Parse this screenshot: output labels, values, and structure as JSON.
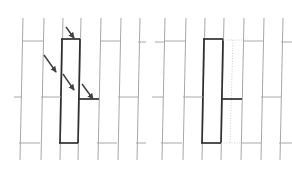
{
  "figure": {
    "background_color": "#ffffff",
    "width": 292,
    "height": 179,
    "colors": {
      "thin_line": "#a8a8a8",
      "thin_line_light": "#bdbdbd",
      "bold_line": "#303030",
      "dotted_line": "#c9c9c9",
      "arrow": "#404040",
      "caption_text": "#ededed"
    },
    "line_widths": {
      "thin": 1.0,
      "bold": 1.7,
      "dotted": 0.9
    }
  },
  "panels": [
    {
      "id": "panel-left",
      "name": "left-panel",
      "label": "",
      "origin_x": 8,
      "width": 136,
      "verticals": [
        {
          "name": "vline-1",
          "x_top": 23,
          "x_bottom": 20,
          "y1": 18,
          "y2": 160,
          "style": "thin"
        },
        {
          "name": "vline-2",
          "x_top": 44,
          "x_bottom": 41,
          "y1": 18,
          "y2": 160,
          "style": "thin"
        },
        {
          "name": "vline-3",
          "x_top": 63,
          "x_bottom": 60,
          "y1": 18,
          "y2": 160,
          "style": "thin"
        },
        {
          "name": "vline-4-bold-left",
          "x_top": 62,
          "x_bottom": 60,
          "y1": 39,
          "y2": 143,
          "style": "bold"
        },
        {
          "name": "vline-5",
          "x_top": 81,
          "x_bottom": 78,
          "y1": 18,
          "y2": 160,
          "style": "thin"
        },
        {
          "name": "vline-6-bold-right",
          "x_top": 80,
          "x_bottom": 78,
          "y1": 39,
          "y2": 143,
          "style": "bold"
        },
        {
          "name": "vline-7",
          "x_top": 101,
          "x_bottom": 98,
          "y1": 18,
          "y2": 160,
          "style": "thin"
        },
        {
          "name": "vline-8",
          "x_top": 121,
          "x_bottom": 118,
          "y1": 18,
          "y2": 160,
          "style": "thin"
        },
        {
          "name": "vline-9",
          "x_top": 140,
          "x_bottom": 137,
          "y1": 18,
          "y2": 160,
          "style": "thin"
        }
      ],
      "horizontals": [
        {
          "name": "hline-top-left",
          "x1": 22,
          "x2": 43,
          "y": 41,
          "style": "thin"
        },
        {
          "name": "hline-top-bold",
          "x1": 61,
          "x2": 80,
          "y": 39,
          "style": "bold"
        },
        {
          "name": "hline-top-right",
          "x1": 100,
          "x2": 120,
          "y": 41,
          "style": "thin"
        },
        {
          "name": "hline-top-edge",
          "x1": 138,
          "x2": 146,
          "y": 42,
          "style": "thin"
        },
        {
          "name": "hline-mid-left-stub",
          "x1": 14,
          "x2": 22,
          "y": 97,
          "style": "thin"
        },
        {
          "name": "hline-mid-a",
          "x1": 41,
          "x2": 61,
          "y": 97,
          "style": "thin"
        },
        {
          "name": "hline-mid-bold",
          "x1": 79,
          "x2": 99,
          "y": 99,
          "style": "bold"
        },
        {
          "name": "hline-mid-b",
          "x1": 118,
          "x2": 138,
          "y": 97,
          "style": "thin"
        },
        {
          "name": "hline-bot-left",
          "x1": 19,
          "x2": 40,
          "y": 143,
          "style": "thin"
        },
        {
          "name": "hline-bot-bold",
          "x1": 59,
          "x2": 78,
          "y": 143,
          "style": "bold"
        },
        {
          "name": "hline-bot-right",
          "x1": 97,
          "x2": 117,
          "y": 143,
          "style": "thin"
        },
        {
          "name": "hline-bot-edge",
          "x1": 136,
          "x2": 146,
          "y": 143,
          "style": "thin"
        }
      ],
      "highlighted_cell": {
        "name": "highlighted-cell-left",
        "x_left": 61,
        "x_right": 80,
        "y_top": 39,
        "y_bottom": 143
      },
      "arrows": [
        {
          "name": "arrow-1",
          "x1": 66,
          "y1": 27,
          "x2": 74,
          "y2": 38
        },
        {
          "name": "arrow-2",
          "x1": 44,
          "y1": 55,
          "x2": 56,
          "y2": 72
        },
        {
          "name": "arrow-3",
          "x1": 63,
          "y1": 74,
          "x2": 74,
          "y2": 90
        },
        {
          "name": "arrow-4",
          "x1": 82,
          "y1": 84,
          "x2": 93,
          "y2": 99
        }
      ]
    },
    {
      "id": "panel-right",
      "name": "right-panel",
      "label": "",
      "origin_x": 152,
      "width": 136,
      "verticals": [
        {
          "name": "vline-1",
          "x_top": 165,
          "x_bottom": 162,
          "y1": 18,
          "y2": 160,
          "style": "thin"
        },
        {
          "name": "vline-2",
          "x_top": 186,
          "x_bottom": 183,
          "y1": 18,
          "y2": 160,
          "style": "thin"
        },
        {
          "name": "vline-3",
          "x_top": 205,
          "x_bottom": 202,
          "y1": 18,
          "y2": 160,
          "style": "thin"
        },
        {
          "name": "vline-4-bold",
          "x_top": 204,
          "x_bottom": 202,
          "y1": 39,
          "y2": 143,
          "style": "bold"
        },
        {
          "name": "vline-5",
          "x_top": 224,
          "x_bottom": 221,
          "y1": 18,
          "y2": 160,
          "style": "thin"
        },
        {
          "name": "vline-6-bold",
          "x_top": 223,
          "x_bottom": 221,
          "y1": 39,
          "y2": 143,
          "style": "bold"
        },
        {
          "name": "vline-7-dotted",
          "x_top": 233,
          "x_bottom": 230,
          "y1": 40,
          "y2": 143,
          "style": "dotted"
        },
        {
          "name": "vline-8",
          "x_top": 244,
          "x_bottom": 241,
          "y1": 18,
          "y2": 160,
          "style": "thin"
        },
        {
          "name": "vline-9",
          "x_top": 264,
          "x_bottom": 261,
          "y1": 18,
          "y2": 160,
          "style": "thin"
        },
        {
          "name": "vline-10",
          "x_top": 283,
          "x_bottom": 280,
          "y1": 18,
          "y2": 160,
          "style": "thin"
        }
      ],
      "horizontals": [
        {
          "name": "hline-top-left-stub",
          "x1": 155,
          "x2": 165,
          "y": 42,
          "style": "thin"
        },
        {
          "name": "hline-top-a",
          "x1": 164,
          "x2": 185,
          "y": 41,
          "style": "thin"
        },
        {
          "name": "hline-top-bold",
          "x1": 203,
          "x2": 223,
          "y": 39,
          "style": "bold"
        },
        {
          "name": "hline-top-dotted",
          "x1": 223,
          "x2": 243,
          "y": 40,
          "style": "dotted"
        },
        {
          "name": "hline-top-b",
          "x1": 243,
          "x2": 263,
          "y": 41,
          "style": "thin"
        },
        {
          "name": "hline-top-edge",
          "x1": 281,
          "x2": 292,
          "y": 42,
          "style": "thin"
        },
        {
          "name": "hline-mid-left-stub",
          "x1": 152,
          "x2": 163,
          "y": 97,
          "style": "thin"
        },
        {
          "name": "hline-mid-a",
          "x1": 183,
          "x2": 203,
          "y": 97,
          "style": "thin"
        },
        {
          "name": "hline-mid-bold",
          "x1": 222,
          "x2": 242,
          "y": 99,
          "style": "bold"
        },
        {
          "name": "hline-mid-b",
          "x1": 261,
          "x2": 281,
          "y": 97,
          "style": "thin"
        },
        {
          "name": "hline-bot-a",
          "x1": 161,
          "x2": 182,
          "y": 143,
          "style": "thin"
        },
        {
          "name": "hline-bot-bold",
          "x1": 201,
          "x2": 221,
          "y": 143,
          "style": "bold"
        },
        {
          "name": "hline-bot-dotted",
          "x1": 221,
          "x2": 241,
          "y": 143,
          "style": "dotted"
        },
        {
          "name": "hline-bot-b",
          "x1": 241,
          "x2": 261,
          "y": 143,
          "style": "thin"
        },
        {
          "name": "hline-bot-edge",
          "x1": 279,
          "x2": 292,
          "y": 143,
          "style": "thin"
        }
      ],
      "highlighted_cell": {
        "name": "highlighted-cell-right",
        "x_left": 203,
        "x_right": 223,
        "y_top": 39,
        "y_bottom": 143
      },
      "arrows": []
    }
  ],
  "caption": {
    "text": "",
    "visible": false
  }
}
